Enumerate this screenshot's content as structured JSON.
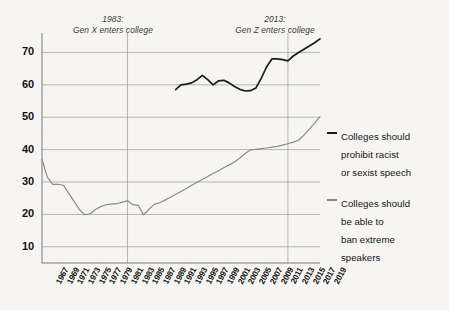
{
  "chart_data": {
    "type": "line",
    "title": "",
    "subtitle": "",
    "xlabel": "",
    "ylabel": "",
    "xlim": [
      1967,
      2019
    ],
    "ylim": [
      5,
      76
    ],
    "yticks": [
      10,
      20,
      30,
      40,
      50,
      60,
      70
    ],
    "grid": "horizontal-and-annotation-verticals",
    "legend_position": "right",
    "tick_labels": [
      "1967",
      "1969",
      "1971",
      "1973",
      "1975",
      "1977",
      "1979",
      "1981",
      "1983",
      "1985",
      "1987",
      "1989",
      "1991",
      "1993",
      "1995",
      "1997",
      "1999",
      "2001",
      "2003",
      "2005",
      "2007",
      "2009",
      "2011",
      "2013",
      "2015",
      "2017",
      "2019"
    ],
    "annotations": [
      {
        "name": "gen-x",
        "year": 1983,
        "line1": "1983:",
        "line2": "Gen X enters college"
      },
      {
        "name": "gen-z",
        "year": 2013,
        "line1": "2013:",
        "line2": "Gen Z enters college"
      }
    ],
    "series": [
      {
        "name": "Colleges should prohibit racist or sexist speech",
        "legend_label": "Colleges should\nprohibit racist\nor sexist speech",
        "color": "#1b1b1b",
        "x": [
          1992,
          1993,
          1994,
          1995,
          1996,
          1997,
          1998,
          1999,
          2000,
          2001,
          2002,
          2003,
          2004,
          2005,
          2006,
          2007,
          2008,
          2009,
          2010,
          2011,
          2012,
          2013,
          2014,
          2015,
          2016,
          2017,
          2018,
          2019
        ],
        "values": [
          58.5,
          60.0,
          60.2,
          60.6,
          61.6,
          62.9,
          61.6,
          60.0,
          61.2,
          61.4,
          60.6,
          59.5,
          58.6,
          58.1,
          58.2,
          59.0,
          62.0,
          65.5,
          68.0,
          68.0,
          67.8,
          67.4,
          68.9,
          70.0,
          71.0,
          72.0,
          73.0,
          74.2
        ]
      },
      {
        "name": "Colleges should be able to ban extreme speakers",
        "legend_label": "Colleges should\nbe able to\nban extreme\nspeakers",
        "color": "#8b8b8b",
        "x": [
          1967,
          1968,
          1969,
          1970,
          1971,
          1972,
          1973,
          1974,
          1975,
          1976,
          1977,
          1978,
          1979,
          1980,
          1981,
          1982,
          1983,
          1984,
          1985,
          1986,
          1987,
          1988,
          1989,
          1990,
          1991,
          1992,
          1993,
          1994,
          1995,
          1996,
          1997,
          1998,
          1999,
          2000,
          2001,
          2002,
          2003,
          2004,
          2005,
          2006,
          2007,
          2008,
          2009,
          2010,
          2011,
          2012,
          2013,
          2014,
          2015,
          2016,
          2017,
          2018,
          2019
        ],
        "values": [
          37.0,
          31.5,
          29.3,
          29.3,
          29.0,
          26.5,
          24.0,
          21.5,
          19.9,
          20.2,
          21.5,
          22.4,
          23.0,
          23.2,
          23.3,
          23.8,
          24.2,
          23.0,
          22.8,
          19.9,
          21.6,
          23.1,
          23.6,
          24.4,
          25.3,
          26.2,
          27.1,
          28.0,
          29.0,
          29.9,
          30.8,
          31.7,
          32.6,
          33.5,
          34.4,
          35.3,
          36.2,
          37.4,
          38.8,
          39.9,
          40.1,
          40.3,
          40.5,
          40.8,
          41.0,
          41.4,
          41.8,
          42.3,
          42.9,
          44.5,
          46.3,
          48.2,
          50.2
        ]
      }
    ]
  },
  "axis": {
    "y_tick_labels": [
      "70",
      "60",
      "50",
      "40",
      "30",
      "20",
      "10"
    ]
  }
}
